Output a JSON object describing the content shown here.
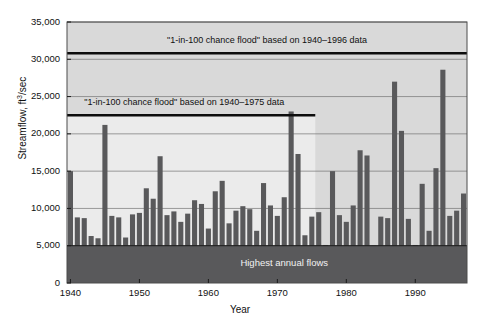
{
  "chart_data": {
    "type": "bar",
    "title": "",
    "xlabel": "Year",
    "ylabel": "Streamflow, ft3/sec",
    "ylabel_display": "Streamflow, ft",
    "ylabel_exponent": "3",
    "ylabel_tail": "/sec",
    "xlim": [
      1939.5,
      1997.5
    ],
    "ylim": [
      0,
      35000
    ],
    "ytick_values": [
      0,
      5000,
      10000,
      15000,
      20000,
      25000,
      30000,
      35000
    ],
    "ytick_labels": [
      "0",
      "5,000",
      "10,000",
      "15,000",
      "20,000",
      "25,000",
      "30,000",
      "35,000"
    ],
    "xtick_values": [
      1940,
      1950,
      1960,
      1970,
      1980,
      1990
    ],
    "xtick_labels": [
      "1940",
      "1950",
      "1960",
      "1970",
      "1980",
      "1990"
    ],
    "grid": "horizontal",
    "legend": "none",
    "series_name": "Highest annual flows",
    "bar_color": "#59595b",
    "plot_background": "#d9d9d9",
    "plot_background_lower": "#ebebeb",
    "band_color": "#59595b",
    "line_color": "#0d0d0d",
    "x": [
      1940,
      1941,
      1942,
      1943,
      1944,
      1945,
      1946,
      1947,
      1948,
      1949,
      1950,
      1951,
      1952,
      1953,
      1954,
      1955,
      1956,
      1957,
      1958,
      1959,
      1960,
      1961,
      1962,
      1963,
      1964,
      1965,
      1966,
      1967,
      1968,
      1969,
      1970,
      1971,
      1972,
      1973,
      1974,
      1975,
      1976,
      1977,
      1978,
      1979,
      1980,
      1981,
      1982,
      1983,
      1984,
      1985,
      1986,
      1987,
      1988,
      1989,
      1990,
      1991,
      1992,
      1993,
      1994,
      1995,
      1996,
      1997
    ],
    "values": [
      15000,
      8800,
      8700,
      6300,
      6000,
      21200,
      9000,
      8800,
      6100,
      9200,
      9400,
      12700,
      11300,
      17000,
      9100,
      9600,
      8200,
      9300,
      11100,
      10600,
      7300,
      12300,
      13700,
      8000,
      9700,
      10300,
      9900,
      7000,
      13400,
      10400,
      9000,
      11500,
      23000,
      17300,
      6400,
      8900,
      9500,
      5100,
      15000,
      9100,
      8200,
      10400,
      17800,
      17100,
      5000,
      8900,
      8700,
      27000,
      20400,
      8600,
      5100,
      13300,
      7000,
      15400,
      28600,
      9000,
      9700,
      12000
    ],
    "annotations": [
      {
        "name": "flood-line-1940-1996",
        "text": "\"1-in-100 chance flood\" based on 1940–1996 data",
        "y_value": 30800,
        "x_start": 1940,
        "x_end": 1997.5,
        "label_x": 1968.5,
        "label_y": 32400
      },
      {
        "name": "flood-line-1940-1975",
        "text": "\"1-in-100 chance flood\" based on 1940–1975 data",
        "y_value": 22500,
        "x_start": 1940,
        "x_end": 1975,
        "label_x": 1956.5,
        "label_y": 24100
      },
      {
        "name": "highest-annual-flows-band",
        "text": "Highest annual flows",
        "y_value": 5000,
        "label_x": 1971,
        "label_y": 2700
      }
    ]
  }
}
